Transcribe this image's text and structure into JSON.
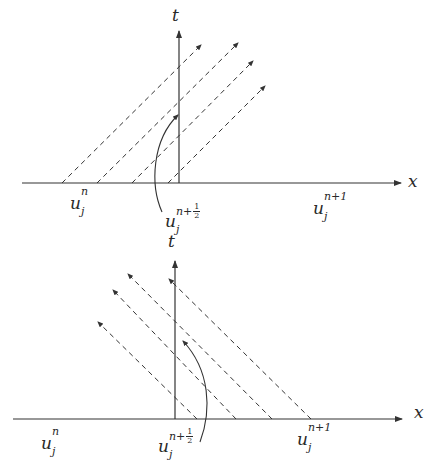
{
  "figure": {
    "colors": {
      "axis": "#333333",
      "dash": "#333333",
      "text": "#2a2a2a"
    }
  },
  "top_panel": {
    "axis_t_label": "t",
    "axis_x_label": "x",
    "labels": {
      "u_n": {
        "base": "u",
        "sub": "j",
        "sup": "n"
      },
      "u_half": {
        "base": "u",
        "sub": "j",
        "sup_prefix": "n+",
        "frac_num": "1",
        "frac_den": "2"
      },
      "u_n1": {
        "base": "u",
        "sub": "j",
        "sup": "n+1"
      }
    },
    "characteristic_direction": "right-moving",
    "num_characteristics": 4
  },
  "bottom_panel": {
    "axis_t_label": "t",
    "axis_x_label": "x",
    "labels": {
      "u_n": {
        "base": "u",
        "sub": "j",
        "sup": "n"
      },
      "u_half": {
        "base": "u",
        "sub": "j",
        "sup_prefix": "n+",
        "frac_num": "1",
        "frac_den": "2"
      },
      "u_n1": {
        "base": "u",
        "sub": "j",
        "sup": "n+1"
      }
    },
    "characteristic_direction": "left-moving",
    "num_characteristics": 4
  }
}
